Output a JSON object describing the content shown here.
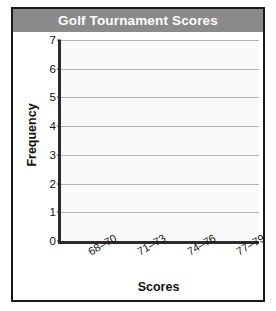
{
  "chart_data": {
    "type": "bar",
    "title": "Golf Tournament Scores",
    "xlabel": "Scores",
    "ylabel": "Frequency",
    "categories": [
      "68–70",
      "71–73",
      "74–76",
      "77–79"
    ],
    "values": [
      null,
      null,
      null,
      null
    ],
    "ylim": [
      0,
      7
    ],
    "yticks": [
      "0",
      "1",
      "2",
      "3",
      "4",
      "5",
      "6",
      "7"
    ],
    "grid": true,
    "legend": false,
    "note": "blank histogram template — no bars plotted"
  },
  "colors": {
    "banner": "#8a8a8a",
    "banner_text": "#ffffff",
    "frame_border": "#1a1a1a",
    "axis": "#2b2b2b",
    "gridline": "#b3b3b3",
    "plot_background": "#fafafa",
    "text": "#111111"
  }
}
